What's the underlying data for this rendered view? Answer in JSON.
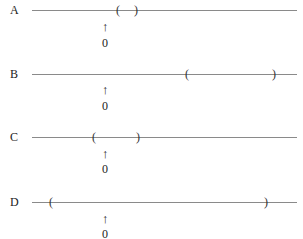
{
  "options": [
    {
      "label": "A",
      "line_y": 10,
      "open_x": 116,
      "close_x": 134,
      "arrow_x": 105,
      "arrow_y": 20,
      "zero_y": 36
    },
    {
      "label": "B",
      "line_y": 74,
      "open_x": 185,
      "close_x": 272,
      "arrow_x": 105,
      "arrow_y": 83,
      "zero_y": 99
    },
    {
      "label": "C",
      "line_y": 137,
      "open_x": 92,
      "close_x": 136,
      "arrow_x": 105,
      "arrow_y": 147,
      "zero_y": 162
    },
    {
      "label": "D",
      "line_y": 202,
      "open_x": 49,
      "close_x": 264,
      "arrow_x": 105,
      "arrow_y": 212,
      "zero_y": 227
    }
  ],
  "open_paren": "(",
  "close_paren": ")",
  "arrow_glyph": "↑",
  "zero_label": "0",
  "line_start_x": 32,
  "line_end_x": 297
}
